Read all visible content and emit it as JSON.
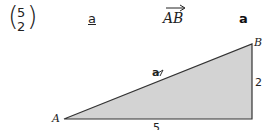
{
  "notations": {
    "column_vector": {
      "top": "5",
      "bottom": "2"
    },
    "underlined": "a",
    "arrow_vector": "AB",
    "bold": "a"
  },
  "triangle": {
    "vertices": {
      "A": "A",
      "B": "B"
    },
    "horizontal_side": "5",
    "vertical_side": "2",
    "hypotenuse_label": "a",
    "fill": "#d3d3d3",
    "stroke": "#333333"
  }
}
